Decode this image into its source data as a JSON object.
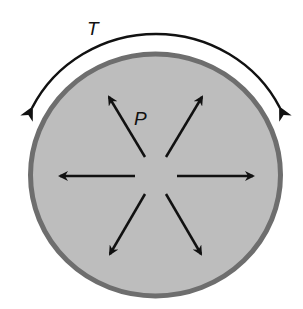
{
  "diagram": {
    "labels": {
      "tension": "T",
      "pressure": "P"
    },
    "colors": {
      "fill": "#bdbdbd",
      "wall": "#6e6e6e",
      "arrow": "#111111",
      "background": "#ffffff"
    },
    "elements": [
      {
        "id": "vessel",
        "type": "circle",
        "description": "gray filled circle with darker wall"
      },
      {
        "id": "tension-arrow",
        "type": "double-headed curved arrow",
        "label": "T"
      },
      {
        "id": "pressure-arrows",
        "type": "6 radial arrows",
        "label": "P",
        "directions_deg": [
          120,
          60,
          180,
          0,
          240,
          300
        ]
      }
    ]
  }
}
